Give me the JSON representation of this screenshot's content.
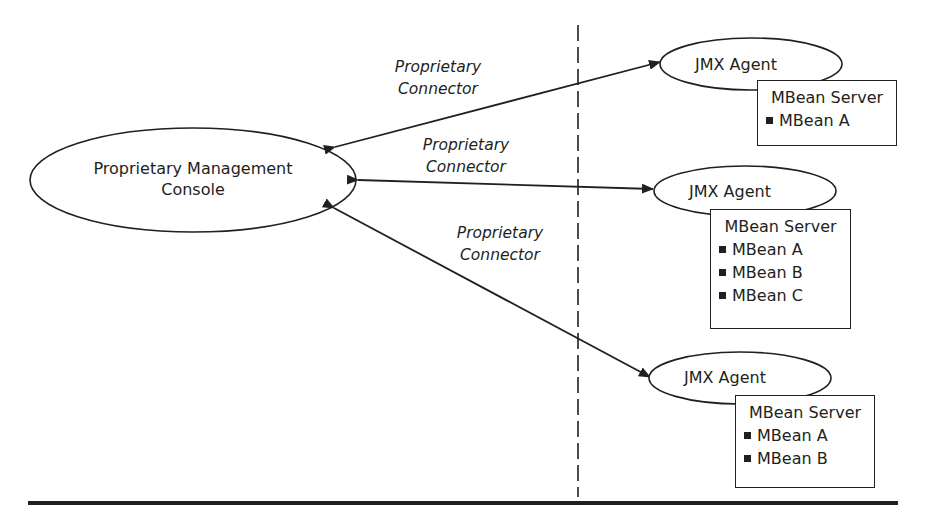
{
  "console": {
    "label_line1": "Proprietary Management",
    "label_line2": "Console"
  },
  "connectors": [
    {
      "line1": "Proprietary",
      "line2": "Connector"
    },
    {
      "line1": "Proprietary",
      "line2": "Connector"
    },
    {
      "line1": "Proprietary",
      "line2": "Connector"
    }
  ],
  "agents": [
    {
      "label": "JMX Agent",
      "server": {
        "title": "MBean Server",
        "mbeans": [
          "MBean A"
        ]
      }
    },
    {
      "label": "JMX Agent",
      "server": {
        "title": "MBean Server",
        "mbeans": [
          "MBean A",
          "MBean B",
          "MBean C"
        ]
      }
    },
    {
      "label": "JMX Agent",
      "server": {
        "title": "MBean Server",
        "mbeans": [
          "MBean A",
          "MBean B"
        ]
      }
    }
  ],
  "colors": {
    "ink": "#231f20",
    "background": "#ffffff"
  }
}
